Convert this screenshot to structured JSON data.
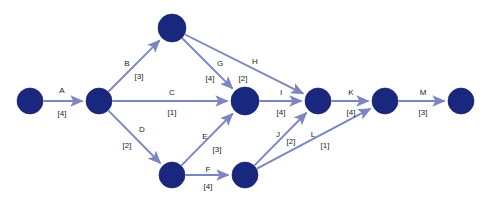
{
  "diagram": {
    "kind": "activity-on-arc-network",
    "background_color": "#ffffff",
    "node_color": "#19287e",
    "edge_color": "#7b86bf",
    "label_color": "#1b1b1b",
    "nodes": [
      {
        "id": "n1",
        "cx": 30,
        "cy": 101,
        "r": 13
      },
      {
        "id": "n2",
        "cx": 99,
        "cy": 101,
        "r": 13
      },
      {
        "id": "n3",
        "cx": 172,
        "cy": 28,
        "r": 14
      },
      {
        "id": "n4",
        "cx": 245,
        "cy": 101,
        "r": 14
      },
      {
        "id": "n5",
        "cx": 172,
        "cy": 175,
        "r": 13
      },
      {
        "id": "n6",
        "cx": 245,
        "cy": 175,
        "r": 13
      },
      {
        "id": "n7",
        "cx": 318,
        "cy": 101,
        "r": 13
      },
      {
        "id": "n8",
        "cx": 385,
        "cy": 101,
        "r": 13
      },
      {
        "id": "n9",
        "cx": 461,
        "cy": 101,
        "r": 13
      }
    ],
    "edges": [
      {
        "id": "edge-a",
        "label": "A",
        "cost": "[4]",
        "from": "n1",
        "to": "n2",
        "label_x": 62,
        "label_y": 91,
        "cost_x": 62,
        "cost_y": 114
      },
      {
        "id": "edge-b",
        "label": "B",
        "cost": "[3]",
        "from": "n2",
        "to": "n3",
        "label_x": 127,
        "label_y": 64,
        "cost_x": 139,
        "cost_y": 77
      },
      {
        "id": "edge-c",
        "label": "C",
        "cost": "[1]",
        "from": "n2",
        "to": "n4",
        "label_x": 172,
        "label_y": 93,
        "cost_x": 172,
        "cost_y": 113
      },
      {
        "id": "edge-d",
        "label": "D",
        "cost": "[2]",
        "from": "n2",
        "to": "n5",
        "label_x": 142,
        "label_y": 130,
        "cost_x": 127,
        "cost_y": 146
      },
      {
        "id": "edge-e",
        "label": "E",
        "cost": "[3]",
        "from": "n5",
        "to": "n4",
        "label_x": 205,
        "label_y": 137,
        "cost_x": 217,
        "cost_y": 150
      },
      {
        "id": "edge-f",
        "label": "F",
        "cost": "[4]",
        "from": "n5",
        "to": "n6",
        "label_x": 208,
        "label_y": 170,
        "cost_x": 208,
        "cost_y": 187
      },
      {
        "id": "edge-g",
        "label": "G",
        "cost": "[4]",
        "from": "n3",
        "to": "n4",
        "label_x": 220,
        "label_y": 64,
        "cost_x": 210,
        "cost_y": 79
      },
      {
        "id": "edge-h",
        "label": "H",
        "cost": "[2]",
        "from": "n3",
        "to": "n7",
        "label_x": 255,
        "label_y": 62,
        "cost_x": 243,
        "cost_y": 79
      },
      {
        "id": "edge-i",
        "label": "I",
        "cost": "[4]",
        "from": "n4",
        "to": "n7",
        "label_x": 281,
        "label_y": 93,
        "cost_x": 281,
        "cost_y": 113
      },
      {
        "id": "edge-j",
        "label": "J",
        "cost": "[2]",
        "from": "n6",
        "to": "n7",
        "label_x": 278,
        "label_y": 135,
        "cost_x": 291,
        "cost_y": 142
      },
      {
        "id": "edge-k",
        "label": "K",
        "cost": "[4]",
        "from": "n7",
        "to": "n8",
        "label_x": 351,
        "label_y": 93,
        "cost_x": 351,
        "cost_y": 113
      },
      {
        "id": "edge-l",
        "label": "L",
        "cost": "[1]",
        "from": "n6",
        "to": "n8",
        "label_x": 313,
        "label_y": 135,
        "cost_x": 325,
        "cost_y": 146
      },
      {
        "id": "edge-m",
        "label": "M",
        "cost": "[3]",
        "from": "n8",
        "to": "n9",
        "label_x": 423,
        "label_y": 93,
        "cost_x": 423,
        "cost_y": 113
      }
    ]
  }
}
